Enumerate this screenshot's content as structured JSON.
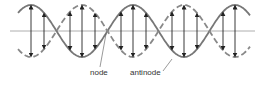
{
  "diagram": {
    "labels": {
      "node": "node",
      "antinode": "antinode"
    },
    "colors": {
      "wave_solid": "#777777",
      "wave_dashed": "#888888",
      "axis": "#999999",
      "arrows": "#222222",
      "text": "#333333"
    },
    "geometry": {
      "axis_y": 31,
      "amplitude": 26,
      "x_start": 18,
      "x_end": 250,
      "wavelength": 102,
      "phase_x": 31,
      "nodes_x": [
        57,
        108,
        159,
        210
      ],
      "antinodes_x": [
        31,
        82,
        133,
        184,
        235
      ]
    }
  }
}
